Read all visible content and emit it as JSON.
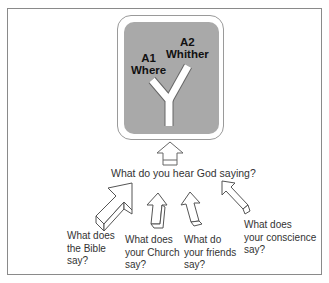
{
  "diagram": {
    "signpost": {
      "option_a1": {
        "code": "A1",
        "label": "Where"
      },
      "option_a2": {
        "code": "A2",
        "label": "Whither"
      },
      "box_color": "#a9a9a9",
      "road_color": "#ffffff"
    },
    "main_question": "What do you hear God saying?",
    "sources": [
      {
        "line1": "What does",
        "line2": "the Bible",
        "line3": "say?"
      },
      {
        "line1": "What does",
        "line2": "your Church",
        "line3": "say?"
      },
      {
        "line1": "What do",
        "line2": "your friends",
        "line3": "say?"
      },
      {
        "line1": "What does",
        "line2": "your conscience",
        "line3": "say?"
      }
    ]
  }
}
